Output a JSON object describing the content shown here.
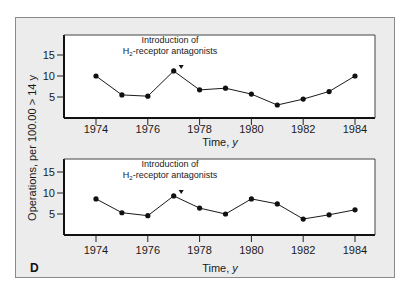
{
  "figure": {
    "panel_letter": "D",
    "ylabel": "Operations, per 100.00 > 14 y",
    "xlabel_text": "Time, ",
    "xlabel_unit": "y",
    "annotation_line1": "Introduction of",
    "annotation_line2_prefix": "H",
    "annotation_line2_sub": "2",
    "annotation_line2_suffix": "-receptor antagonists",
    "colors": {
      "panel_bg": "#ececec",
      "plot_bg": "#ffffff",
      "line": "#1a1a1a"
    }
  },
  "chart_data": [
    {
      "type": "line",
      "title": "",
      "annotation": "Introduction of H2-receptor antagonists (arrow at ~1977.3)",
      "xlabel": "Time, y",
      "ylabel": "Operations, per 100.00 > 14 y",
      "x": [
        1974,
        1975,
        1976,
        1977,
        1978,
        1979,
        1980,
        1981,
        1982,
        1983,
        1984
      ],
      "values": [
        10.0,
        5.5,
        5.2,
        11.2,
        6.7,
        7.1,
        5.7,
        3.1,
        4.5,
        6.3,
        10.0
      ],
      "xticks": [
        1974,
        1976,
        1978,
        1980,
        1982,
        1984
      ],
      "yticks": [
        5,
        10,
        15
      ],
      "xlim": [
        1972.8,
        1984.8
      ],
      "ylim": [
        0,
        19.5
      ],
      "grid": false
    },
    {
      "type": "line",
      "title": "",
      "annotation": "Introduction of H2-receptor antagonists (arrow at ~1977.3)",
      "xlabel": "Time, y",
      "ylabel": "Operations, per 100.00 > 14 y",
      "x": [
        1974,
        1975,
        1976,
        1977,
        1978,
        1979,
        1980,
        1981,
        1982,
        1983,
        1984
      ],
      "values": [
        8.6,
        5.3,
        4.6,
        9.3,
        6.4,
        5.0,
        8.6,
        7.4,
        3.8,
        4.8,
        6.0
      ],
      "xticks": [
        1974,
        1976,
        1978,
        1980,
        1982,
        1984
      ],
      "yticks": [
        5,
        10,
        15
      ],
      "xlim": [
        1972.8,
        1984.8
      ],
      "ylim": [
        0,
        19.5
      ],
      "grid": false
    }
  ]
}
